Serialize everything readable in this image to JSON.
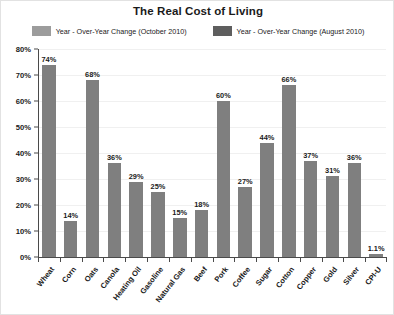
{
  "chart_data": {
    "type": "bar",
    "title": "The Real Cost of Living",
    "xlabel": "",
    "ylabel": "",
    "ylim": [
      0,
      80
    ],
    "ytick_values": [
      80,
      70,
      60,
      50,
      40,
      30,
      20,
      10,
      0
    ],
    "ytick_labels": [
      "80%",
      "70%",
      "60%",
      "50%",
      "40%",
      "30%",
      "20%",
      "10%",
      "0%"
    ],
    "grid": true,
    "legend_position": "top-center",
    "legend": [
      {
        "label": "Year - Over-Year Change (October 2010)",
        "color": "#9c9c9c"
      },
      {
        "label": "Year - Over-Year Change (August 2010)",
        "color": "#5e5e5e"
      }
    ],
    "series": [
      {
        "name": "Year - Over-Year Change (October 2010)",
        "color": "#7f7f7f",
        "values": [
          74,
          14,
          68,
          36,
          29,
          25,
          15,
          18,
          60,
          27,
          44,
          66,
          37,
          31,
          36,
          1.1
        ]
      }
    ],
    "categories": [
      "Wheat",
      "Corn",
      "Oats",
      "Canola",
      "Heating Oil",
      "Gasoline",
      "Natural Gas",
      "Beef",
      "Pork",
      "Coffee",
      "Sugar",
      "Cotton",
      "Copper",
      "Gold",
      "Silver",
      "CPI-U"
    ],
    "data_labels": [
      "74%",
      "14%",
      "68%",
      "36%",
      "29%",
      "25%",
      "15%",
      "18%",
      "60%",
      "27%",
      "44%",
      "66%",
      "37%",
      "31%",
      "36%",
      "1.1%"
    ]
  }
}
